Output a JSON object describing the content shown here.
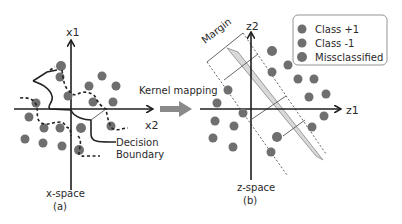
{
  "figure": {
    "panel_a": {
      "x_axis_label": "x2",
      "y_axis_label": "x1",
      "caption_line1": "x-space",
      "caption_line2": "(a)",
      "annotation_line1": "Decision",
      "annotation_line2": "Boundary"
    },
    "arrow": {
      "label": "Kernel mapping"
    },
    "panel_b": {
      "x_axis_label": "z1",
      "y_axis_label": "z2",
      "caption_line1": "z-space",
      "caption_line2": "(b)",
      "margin_label": "Margin"
    },
    "legend": {
      "items": [
        {
          "label": "Class +1",
          "color": "#6f6f6f"
        },
        {
          "label": "Class -1",
          "color": "#6f6f6f"
        },
        {
          "label": "Missclassified",
          "color": "#6f6f6f"
        }
      ]
    },
    "colors": {
      "dot": "#6f6f6f",
      "axis": "#1e1e1e",
      "margin_band": "#d9d9d9",
      "arrow": "#8a8a8a"
    }
  }
}
